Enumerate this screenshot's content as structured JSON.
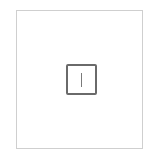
{
  "frame": {
    "border_color": "#cfcfcf"
  },
  "input": {
    "value": "",
    "border_color": "#6a6a6a",
    "cursor_visible": true,
    "cursor_color": "#7a7a7a"
  }
}
